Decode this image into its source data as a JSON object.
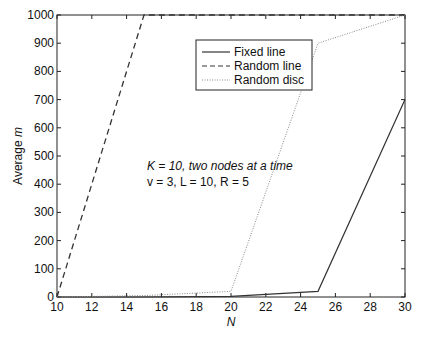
{
  "chart_data": {
    "type": "line",
    "title": "",
    "xlabel": "N",
    "ylabel": "Average m",
    "xlim": [
      10,
      30
    ],
    "ylim": [
      0,
      1000
    ],
    "xticks": [
      10,
      12,
      14,
      16,
      18,
      20,
      22,
      24,
      26,
      28,
      30
    ],
    "yticks": [
      0,
      100,
      200,
      300,
      400,
      500,
      600,
      700,
      800,
      900,
      1000
    ],
    "grid": false,
    "legend_position": "upper center",
    "x": [
      10,
      15,
      20,
      25,
      30
    ],
    "series": [
      {
        "name": "Fixed line",
        "style": "solid",
        "values": [
          0,
          0,
          2,
          20,
          700
        ]
      },
      {
        "name": "Random line",
        "style": "dashed",
        "values": [
          0,
          1000,
          1000,
          1000,
          1000
        ]
      },
      {
        "name": "Random disc",
        "style": "dotted",
        "values": [
          0,
          5,
          20,
          900,
          1000
        ]
      }
    ],
    "annotations": [
      "K = 10, two nodes at a time",
      "v = 3, L = 10, R = 5"
    ]
  },
  "labels": {
    "xlabel": "N",
    "ylabel_main": "Average ",
    "ylabel_var": "m",
    "legend": [
      "Fixed line",
      "Random line",
      "Random disc"
    ],
    "annot1": "K = 10, two nodes at a time",
    "annot2": "v = 3, L = 10, R = 5"
  }
}
